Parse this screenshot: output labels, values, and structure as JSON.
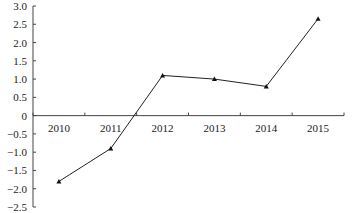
{
  "chart_data": {
    "type": "line",
    "title": "",
    "xlabel": "",
    "ylabel": "",
    "categories": [
      "2010",
      "2011",
      "2012",
      "2013",
      "2014",
      "2015"
    ],
    "series": [
      {
        "name": "series-1",
        "values": [
          -1.8,
          -0.9,
          1.1,
          1.0,
          0.8,
          2.65
        ],
        "marker": "triangle"
      }
    ],
    "ylim": [
      -2.5,
      3.0
    ],
    "yticks": [
      "3.0",
      "2.5",
      "2.0",
      "1.5",
      "1.0",
      "0.5",
      "0",
      "-0.5",
      "-1.0",
      "-1.5",
      "-2.0",
      "-2.5"
    ],
    "ytick_values": [
      3.0,
      2.5,
      2.0,
      1.5,
      1.0,
      0.5,
      0,
      -0.5,
      -1.0,
      -1.5,
      -2.0,
      -2.5
    ],
    "grid": false,
    "legend": "none",
    "x_axis_position": "y=0"
  }
}
